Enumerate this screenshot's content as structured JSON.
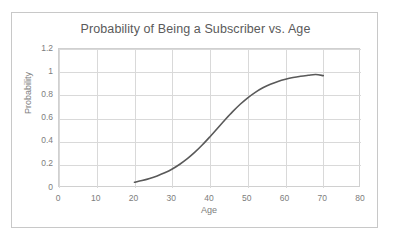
{
  "chart_data": {
    "type": "line",
    "title": "Probability of Being a Subscriber vs. Age",
    "xlabel": "Age",
    "ylabel": "Probability",
    "xlim": [
      0,
      80
    ],
    "ylim": [
      0,
      1.2
    ],
    "xticks": [
      "0",
      "10",
      "20",
      "30",
      "40",
      "50",
      "60",
      "70",
      "80"
    ],
    "yticks": [
      "0",
      "0.2",
      "0.4",
      "0.6",
      "0.8",
      "1",
      "1.2"
    ],
    "xtick_values": [
      0,
      10,
      20,
      30,
      40,
      50,
      60,
      70,
      80
    ],
    "ytick_values": [
      0,
      0.2,
      0.4,
      0.6,
      0.8,
      1,
      1.2
    ],
    "grid": true,
    "legend": "none",
    "series": [
      {
        "name": "Probability of being a subscriber",
        "color": "#595959",
        "line_width": 1.6,
        "x": [
          20,
          22,
          24,
          26,
          28,
          30,
          32,
          34,
          36,
          38,
          40,
          42,
          44,
          46,
          48,
          50,
          52,
          54,
          56,
          58,
          60,
          62,
          64,
          66,
          68,
          70
        ],
        "y": [
          0.05,
          0.064,
          0.082,
          0.104,
          0.131,
          0.164,
          0.205,
          0.253,
          0.309,
          0.373,
          0.443,
          0.516,
          0.589,
          0.659,
          0.723,
          0.779,
          0.826,
          0.865,
          0.896,
          0.92,
          0.939,
          0.954,
          0.965,
          0.973,
          0.98,
          0.97
        ]
      }
    ]
  },
  "chart": {
    "title": "Probability of Being a Subscriber vs. Age",
    "x_axis_title": "Age",
    "y_axis_title": "Probability"
  },
  "colors": {
    "series_line": "#595959",
    "gridline": "#d9d9d9",
    "plot_border": "#d0d0d0",
    "frame_border": "#c8c8c8",
    "text": "#5a5a5a",
    "tick_text": "#7d7d7d",
    "background": "#ffffff"
  }
}
